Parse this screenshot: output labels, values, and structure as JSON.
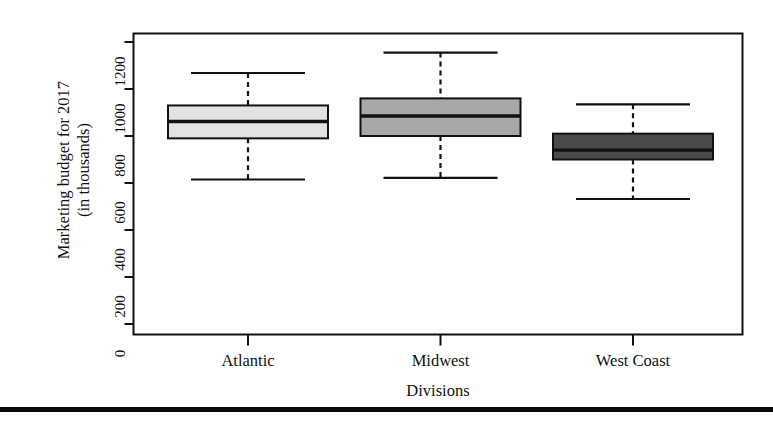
{
  "figure": {
    "y_axis_title_line1": "Marketing budget for 2017",
    "y_axis_title_line2": "(in thousands)",
    "x_axis_title": "Divisions"
  },
  "chart_data": {
    "type": "box",
    "title": "",
    "xlabel": "Divisions",
    "ylabel": "Marketing budget for 2017 (in thousands)",
    "categories": [
      "Atlantic",
      "Midwest",
      "West Coast"
    ],
    "ylim": [
      0,
      1200
    ],
    "yticks": [
      0,
      200,
      400,
      600,
      800,
      1000,
      1200
    ],
    "ytick_labels": [
      "0",
      "200",
      "400",
      "600",
      "800",
      "1000",
      "1200"
    ],
    "grid": false,
    "legend": "none",
    "box_fill_colors": [
      "#e3e3e3",
      "#a8a8a8",
      "#4a4a4a"
    ],
    "series": [
      {
        "name": "Atlantic",
        "fill": "#e3e3e3",
        "min": 615,
        "q1": 790,
        "median": 862,
        "q3": 930,
        "max": 1068
      },
      {
        "name": "Midwest",
        "fill": "#a8a8a8",
        "min": 622,
        "q1": 800,
        "median": 885,
        "q3": 960,
        "max": 1155
      },
      {
        "name": "West Coast",
        "fill": "#4a4a4a",
        "min": 532,
        "q1": 700,
        "median": 740,
        "q3": 810,
        "max": 935
      }
    ]
  }
}
